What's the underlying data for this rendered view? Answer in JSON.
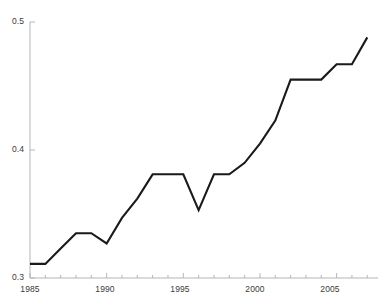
{
  "chart_data": {
    "type": "line",
    "title": "",
    "xlabel": "",
    "ylabel": "",
    "xlim": [
      1985,
      2007.7
    ],
    "ylim": [
      0.3,
      0.5
    ],
    "grid": false,
    "legend": false,
    "legend_position": "none",
    "line_color": "#1a1a1a",
    "x": [
      1985,
      1986,
      1987,
      1988,
      1989,
      1990,
      1991,
      1992,
      1993,
      1994,
      1995,
      1996,
      1997,
      1998,
      1999,
      2000,
      2001,
      2002,
      2003,
      2004,
      2005,
      2006,
      2007
    ],
    "values": [
      0.311,
      0.311,
      0.323,
      0.335,
      0.335,
      0.327,
      0.347,
      0.362,
      0.381,
      0.381,
      0.381,
      0.353,
      0.381,
      0.381,
      0.39,
      0.405,
      0.423,
      0.455,
      0.455,
      0.455,
      0.467,
      0.467,
      0.488
    ],
    "series": [
      {
        "name": "",
        "values": [
          0.311,
          0.311,
          0.323,
          0.335,
          0.335,
          0.327,
          0.347,
          0.362,
          0.381,
          0.381,
          0.381,
          0.353,
          0.381,
          0.381,
          0.39,
          0.405,
          0.423,
          0.455,
          0.455,
          0.455,
          0.467,
          0.467,
          0.488
        ]
      }
    ],
    "y_axis": {
      "tick_labels": [
        "0.5",
        "0.4",
        "0.3"
      ],
      "tick_values": [
        0.5,
        0.4,
        0.3
      ]
    },
    "x_axis": {
      "tick_labels": [
        "1985",
        "1990",
        "1995",
        "2000",
        "2005"
      ],
      "tick_values": [
        1985,
        1990,
        1995,
        2000,
        2005
      ],
      "minor_tick_interval": 1
    }
  },
  "axis": {
    "y_label_top": "0.5",
    "y_label_mid": "0.4",
    "y_label_bottom": "0.3",
    "x_label_1": "1985",
    "x_label_2": "1990",
    "x_label_3": "1995",
    "x_label_4": "2000",
    "x_label_5": "2005"
  },
  "colors": {
    "line": "#1a1a1a",
    "axis": "#b5b5b5",
    "text": "#3a3a3a",
    "background": "#ffffff"
  }
}
